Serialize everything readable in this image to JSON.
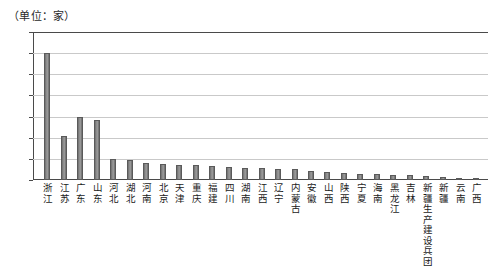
{
  "caption": "（单位：家）",
  "chart_data": {
    "type": "bar",
    "title": "",
    "subtitle": "",
    "xlabel": "",
    "ylabel": "（单位：家）",
    "ylim": [
      0,
      140
    ],
    "ytick_labels": [
      "140",
      "120",
      "100",
      "80",
      "60",
      "40",
      "20",
      "0"
    ],
    "ytick_values": [
      140,
      120,
      100,
      80,
      60,
      40,
      20,
      0
    ],
    "grid": true,
    "legend": "none",
    "orientation": "vertical",
    "categories": [
      "浙江",
      "江苏",
      "广东",
      "山东",
      "河北",
      "湖北",
      "河南",
      "北京",
      "天津",
      "重庆",
      "福建",
      "四川",
      "湖南",
      "江西",
      "辽宁",
      "内蒙古",
      "安徽",
      "山西",
      "陕西",
      "宁夏",
      "海南",
      "黑龙江",
      "吉林",
      "新疆生产建设兵团",
      "新疆",
      "云南",
      "广西"
    ],
    "values": [
      120,
      42,
      60,
      57,
      20,
      19,
      16,
      15,
      14,
      14,
      13,
      12,
      11,
      11,
      10,
      10,
      9,
      8,
      7,
      6,
      6,
      5,
      5,
      4,
      3,
      2,
      2
    ],
    "series": [
      {
        "name": "家数",
        "values": [
          120,
          42,
          60,
          57,
          20,
          19,
          16,
          15,
          14,
          14,
          13,
          12,
          11,
          11,
          10,
          10,
          9,
          8,
          7,
          6,
          6,
          5,
          5,
          4,
          3,
          2,
          2
        ]
      }
    ],
    "bar_color": "#8d8d8d",
    "bar_edge_color": "#5a5a5a",
    "gridline_color": "#c9c9c9",
    "axis_color": "#4a4a4a"
  }
}
